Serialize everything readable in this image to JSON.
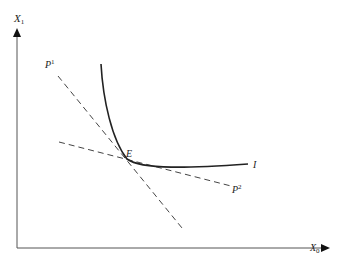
{
  "diagram": {
    "type": "indifference-curve-tangency",
    "axes": {
      "y_label": "X",
      "y_subscript": "1",
      "x_label": "X",
      "x_subscript": "0"
    },
    "curve": {
      "label": "I"
    },
    "lines": [
      {
        "label": "P",
        "superscript": "1",
        "style": "dashed"
      },
      {
        "label": "P",
        "superscript": "2",
        "style": "dashed"
      }
    ],
    "point": {
      "label": "E"
    },
    "colors": {
      "line": "#333333",
      "axis": "#555555",
      "background": "#ffffff"
    }
  }
}
